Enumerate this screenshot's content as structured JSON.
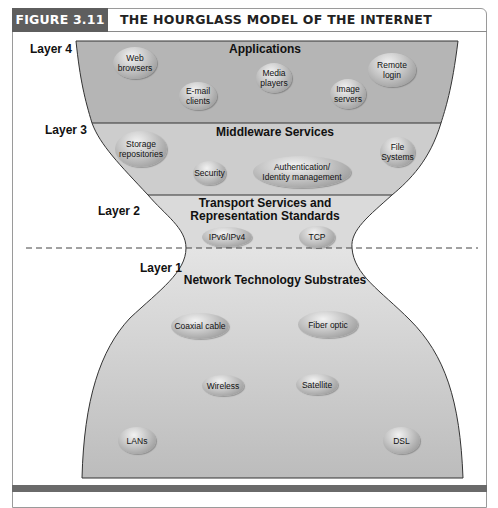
{
  "figure": {
    "label": "FIGURE 3.11",
    "title": "THE HOURGLASS MODEL OF THE INTERNET"
  },
  "colors": {
    "header_label_bg": "#5e5e5e",
    "layer4_fill": "#b5b5b5",
    "layer3_fill": "#cdcdcd",
    "layer2_fill": "#dadada",
    "layer1_fill_top": "#e4e4e4",
    "layer1_fill_bottom": "#bdbdbd",
    "outline": "#333333",
    "bottom_bar": "#6a6a6a"
  },
  "layers": [
    {
      "id": "layer4",
      "label": "Layer 4",
      "title": "Applications",
      "items": [
        "Web browsers",
        "E-mail clients",
        "Media players",
        "Image servers",
        "Remote login"
      ]
    },
    {
      "id": "layer3",
      "label": "Layer 3",
      "title": "Middleware Services",
      "items": [
        "Storage repositories",
        "Security",
        "Authentication/ Identity management",
        "File Systems"
      ]
    },
    {
      "id": "layer2",
      "label": "Layer 2",
      "title_line1": "Transport Services and",
      "title_line2": "Representation Standards",
      "items": [
        "IPv6/IPv4",
        "TCP"
      ]
    },
    {
      "id": "layer1",
      "label": "Layer 1",
      "title": "Network Technology Substrates",
      "items": [
        "Coaxial cable",
        "Fiber optic",
        "Wireless",
        "Satellite",
        "LANs",
        "DSL"
      ]
    }
  ],
  "pills": {
    "web_browsers": {
      "l1": "Web",
      "l2": "browsers"
    },
    "email_clients": {
      "l1": "E-mail",
      "l2": "clients"
    },
    "media_players": {
      "l1": "Media",
      "l2": "players"
    },
    "image_servers": {
      "l1": "Image",
      "l2": "servers"
    },
    "remote_login": {
      "l1": "Remote",
      "l2": "login"
    },
    "storage_repositories": {
      "l1": "Storage",
      "l2": "repositories"
    },
    "security": {
      "l1": "Security"
    },
    "auth_identity": {
      "l1": "Authentication/",
      "l2": "Identity management"
    },
    "file_systems": {
      "l1": "File",
      "l2": "Systems"
    },
    "ipv6_ipv4": {
      "l1": "IPv6/IPv4"
    },
    "tcp": {
      "l1": "TCP"
    },
    "coaxial_cable": {
      "l1": "Coaxial cable"
    },
    "fiber_optic": {
      "l1": "Fiber optic"
    },
    "wireless": {
      "l1": "Wireless"
    },
    "satellite": {
      "l1": "Satellite"
    },
    "lans": {
      "l1": "LANs"
    },
    "dsl": {
      "l1": "DSL"
    }
  }
}
